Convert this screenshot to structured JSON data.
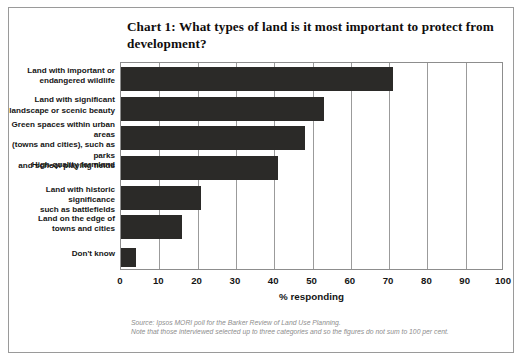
{
  "chart_data": {
    "type": "bar",
    "orientation": "horizontal",
    "title": "Chart 1: What types of land is it most important to protect from development?",
    "categories": [
      "Land with important or endangered wildlife",
      "Land with significant landscape or scenic beauty",
      "Green spaces within urban areas (towns and cities), such as parks and school playing fields",
      "High-quality farmland",
      "Land with historic significance such as battlefields",
      "Land on the edge of towns and cities",
      "Don't know"
    ],
    "category_lines": [
      [
        "Land with important or",
        "endangered wildlife"
      ],
      [
        "Land with significant",
        "landscape or scenic beauty"
      ],
      [
        "Green spaces within urban areas",
        "(towns and cities), such as parks",
        "and school playing fields"
      ],
      [
        "High-quality farmland"
      ],
      [
        "Land with historic significance",
        "such as battlefields"
      ],
      [
        "Land on the edge of",
        "towns and cities"
      ],
      [
        "Don't know"
      ]
    ],
    "values": [
      71,
      53,
      48,
      41,
      21,
      16,
      4
    ],
    "xlabel": "% responding",
    "ylabel": "",
    "xlim": [
      0,
      100
    ],
    "xticks": [
      0,
      10,
      20,
      30,
      40,
      50,
      60,
      70,
      80,
      90,
      100
    ],
    "xticklabels": [
      "0",
      "10",
      "20",
      "30",
      "40",
      "50",
      "60",
      "70",
      "80",
      "90",
      "100"
    ],
    "grid": "vertical",
    "legend": "none",
    "bar_color": "#2b2a28"
  },
  "footnote": {
    "line1": "Source: Ipsos MORI poll for the Barker Review of Land Use Planning.",
    "line2": "Note that those interviewed selected up to three categories and so the figures do not sum to 100 per cent."
  }
}
